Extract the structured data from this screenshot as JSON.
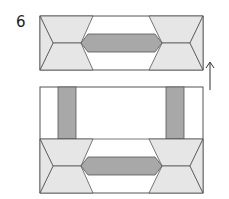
{
  "diagram": {
    "step_number": "6",
    "colors": {
      "light_fill": "#e6e6e6",
      "dark_fill": "#a8a8a8",
      "stroke": "#555555",
      "background": "#ffffff"
    },
    "top_block": {
      "x": 40,
      "y": 16,
      "w": 163,
      "h": 54
    },
    "bottom_block": {
      "x": 40,
      "y": 87,
      "w": 163,
      "h": 106
    },
    "arrow": {
      "direction": "up",
      "x": 210,
      "y1": 90,
      "y2": 62
    }
  }
}
